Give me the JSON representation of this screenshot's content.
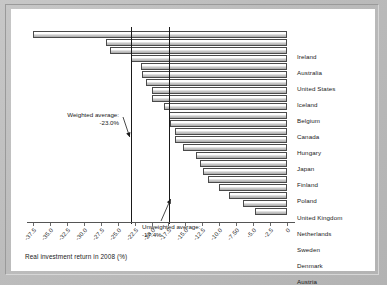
{
  "chart_data": {
    "type": "bar",
    "orientation": "horizontal",
    "title": "",
    "subtitle": "",
    "xlabel": "Real investment return in 2008 (%)",
    "ylabel": "",
    "xlim": [
      -37.5,
      0
    ],
    "grid": false,
    "legend": "none",
    "categories": [
      "Ireland",
      "Australia",
      "United States",
      "Iceland",
      "Belgium",
      "Canada",
      "Hungary",
      "Japan",
      "Finland",
      "Poland",
      "United Kingdom",
      "Netherlands",
      "Sweden",
      "Denmark",
      "Austria",
      "Portugal",
      "Switzerland",
      "Norway",
      "Spain",
      "Slovak Republic",
      "Germany",
      "Czech Republic",
      "Mexico"
    ],
    "values": [
      -37.5,
      -26.7,
      -26.2,
      -23.0,
      -21.6,
      -21.4,
      -20.8,
      -20.0,
      -19.9,
      -18.2,
      -17.4,
      -17.3,
      -16.6,
      -16.6,
      -15.4,
      -13.5,
      -12.9,
      -12.4,
      -11.6,
      -10.0,
      -8.5,
      -6.5,
      -4.7
    ],
    "xticks": [
      -37.5,
      -35.0,
      -32.5,
      -30.0,
      -27.5,
      -25.0,
      -22.5,
      -20.0,
      -17.5,
      -15.0,
      -12.5,
      -10.0,
      -7.5,
      -5.0,
      -2.5,
      0
    ],
    "xticklabels": [
      "-37.5",
      "-35.0",
      "-32.5",
      "-30.0",
      "-27.5",
      "-25.0",
      "-22.5",
      "-20.0",
      "-17.5",
      "-15.0",
      "-12.5",
      "-10.0",
      "-7.50",
      "-5.0",
      "-2.5",
      "0"
    ],
    "reference_lines": [
      {
        "name": "weighted-average",
        "value": -23.0,
        "label_line1": "Weighted average:",
        "label_line2": "-23.0%"
      },
      {
        "name": "unweighted-average",
        "value": -17.4,
        "label_line1": "Unweighted average:",
        "label_line2": "-17.4%"
      }
    ],
    "colors": {
      "bar_fill": "#d9d9d9",
      "bar_edge": "#4a4a4a",
      "reference_line": "#1a1a1a",
      "panel_background": "#ffffff",
      "page_background": "#bcbcbc",
      "text": "#1a1a1a"
    }
  }
}
